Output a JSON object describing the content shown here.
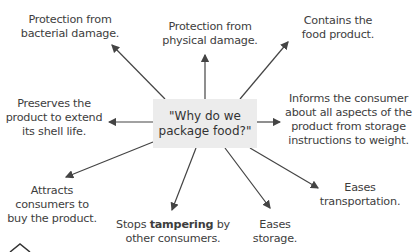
{
  "center": {
    "line1": "\"Why do we",
    "line2": "package food?\""
  },
  "nodes": [
    {
      "id": "bacterial",
      "lines": [
        "Protection from",
        "bacterial damage."
      ]
    },
    {
      "id": "physical",
      "lines": [
        "Protection from",
        "physical damage."
      ]
    },
    {
      "id": "contains",
      "lines": [
        "Contains the",
        "food product."
      ]
    },
    {
      "id": "informs",
      "lines": [
        "Informs the consumer",
        "about all aspects of the",
        "product from storage",
        "instructions to weight."
      ]
    },
    {
      "id": "shelf",
      "lines": [
        "Preserves the",
        "product to extend",
        "its shell life."
      ]
    },
    {
      "id": "attracts",
      "lines": [
        "Attracts",
        "consumers to",
        "buy the product."
      ]
    },
    {
      "id": "tampering",
      "pre": "Stops ",
      "bold": "tampering",
      "post": " by",
      "line2": "other consumers."
    },
    {
      "id": "storage",
      "lines": [
        "Eases",
        "storage."
      ]
    },
    {
      "id": "transport",
      "lines": [
        "Eases",
        "transportation."
      ]
    }
  ]
}
